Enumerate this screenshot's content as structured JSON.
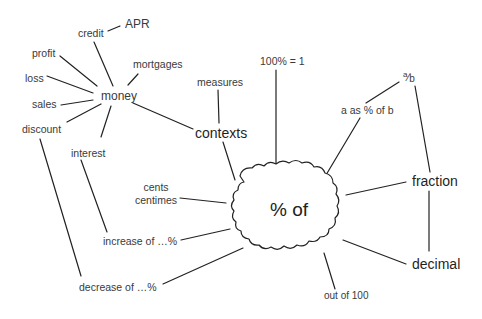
{
  "diagram": {
    "type": "concept-map",
    "center": {
      "id": "percent_of",
      "label": "% of"
    },
    "nodes": {
      "apr": "APR",
      "credit": "credit",
      "profit": "profit",
      "mortgages": "mortgages",
      "loss": "loss",
      "money": "money",
      "sales": "sales",
      "discount": "discount",
      "interest": "interest",
      "measures": "measures",
      "contexts": "contexts",
      "hundred_equals_one": "100% = 1",
      "a_over_b_num": "a",
      "a_over_b_slash": "⁄",
      "a_over_b_den": "b",
      "a_as_percent_of_b": "a as % of b",
      "cents": "cents",
      "centimes": "centimes",
      "fraction": "fraction",
      "increase_of": "increase of …%",
      "decimal": "decimal",
      "decrease_of": "decrease of …%",
      "out_of_100": "out of 100"
    },
    "edges": [
      [
        "credit",
        "apr"
      ],
      [
        "money",
        "credit"
      ],
      [
        "money",
        "profit"
      ],
      [
        "money",
        "loss"
      ],
      [
        "money",
        "sales"
      ],
      [
        "money",
        "discount"
      ],
      [
        "money",
        "mortgages"
      ],
      [
        "money",
        "interest"
      ],
      [
        "money",
        "contexts"
      ],
      [
        "measures",
        "contexts"
      ],
      [
        "contexts",
        "percent_of"
      ],
      [
        "hundred_equals_one",
        "percent_of"
      ],
      [
        "a_as_percent_of_b",
        "percent_of"
      ],
      [
        "a_as_percent_of_b",
        "a_over_b"
      ],
      [
        "a_over_b",
        "fraction"
      ],
      [
        "fraction",
        "percent_of"
      ],
      [
        "fraction",
        "decimal"
      ],
      [
        "decimal",
        "percent_of"
      ],
      [
        "out_of_100",
        "percent_of"
      ],
      [
        "cents_centimes",
        "percent_of"
      ],
      [
        "increase_of",
        "percent_of"
      ],
      [
        "interest",
        "increase_of"
      ],
      [
        "decrease_of",
        "percent_of"
      ],
      [
        "discount",
        "decrease_of"
      ]
    ]
  }
}
